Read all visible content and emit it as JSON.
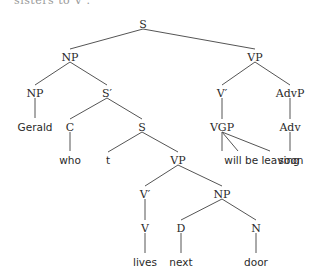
{
  "clipped_header": {
    "text": "sisters to V ."
  },
  "tree": {
    "nodes": [
      {
        "id": "S0",
        "label": "S",
        "x": 143,
        "y": 24,
        "kind": "cat"
      },
      {
        "id": "NP0",
        "label": "NP",
        "x": 70,
        "y": 57,
        "kind": "cat"
      },
      {
        "id": "VP0",
        "label": "VP",
        "x": 255,
        "y": 57,
        "kind": "cat"
      },
      {
        "id": "NP1",
        "label": "NP",
        "x": 35,
        "y": 93,
        "kind": "cat"
      },
      {
        "id": "Sbar",
        "label": "S′",
        "x": 107,
        "y": 93,
        "kind": "cat"
      },
      {
        "id": "Vbar0",
        "label": "V′",
        "x": 222,
        "y": 93,
        "kind": "cat"
      },
      {
        "id": "AdvP",
        "label": "AdvP",
        "x": 290,
        "y": 93,
        "kind": "cat"
      },
      {
        "id": "Gerald",
        "label": "Gerald",
        "x": 35,
        "y": 127,
        "kind": "word"
      },
      {
        "id": "C",
        "label": "C",
        "x": 70,
        "y": 127,
        "kind": "cat"
      },
      {
        "id": "S1",
        "label": "S",
        "x": 142,
        "y": 127,
        "kind": "cat"
      },
      {
        "id": "VGP",
        "label": "VGP",
        "x": 222,
        "y": 127,
        "kind": "cat"
      },
      {
        "id": "Adv",
        "label": "Adv",
        "x": 290,
        "y": 127,
        "kind": "cat"
      },
      {
        "id": "who",
        "label": "who",
        "x": 70,
        "y": 160,
        "kind": "word"
      },
      {
        "id": "t",
        "label": "t",
        "x": 108,
        "y": 160,
        "kind": "word"
      },
      {
        "id": "VP1",
        "label": "VP",
        "x": 178,
        "y": 160,
        "kind": "cat"
      },
      {
        "id": "will",
        "label": "will be leaving",
        "x": 262,
        "y": 160,
        "kind": "word"
      },
      {
        "id": "soon",
        "label": "soon",
        "x": 291,
        "y": 160,
        "kind": "word"
      },
      {
        "id": "Vbar1",
        "label": "V′",
        "x": 145,
        "y": 194,
        "kind": "cat"
      },
      {
        "id": "NP2",
        "label": "NP",
        "x": 222,
        "y": 194,
        "kind": "cat"
      },
      {
        "id": "V",
        "label": "V",
        "x": 145,
        "y": 228,
        "kind": "cat"
      },
      {
        "id": "D",
        "label": "D",
        "x": 181,
        "y": 228,
        "kind": "cat"
      },
      {
        "id": "N",
        "label": "N",
        "x": 256,
        "y": 228,
        "kind": "cat"
      },
      {
        "id": "lives",
        "label": "lives",
        "x": 145,
        "y": 262,
        "kind": "word"
      },
      {
        "id": "next",
        "label": "next",
        "x": 181,
        "y": 262,
        "kind": "word"
      },
      {
        "id": "door",
        "label": "door",
        "x": 256,
        "y": 262,
        "kind": "word"
      }
    ],
    "edges": [
      [
        143,
        29,
        70,
        49
      ],
      [
        143,
        29,
        255,
        49
      ],
      [
        70,
        62,
        35,
        85
      ],
      [
        70,
        62,
        107,
        85
      ],
      [
        255,
        62,
        222,
        85
      ],
      [
        255,
        62,
        290,
        85
      ],
      [
        35,
        98,
        35,
        118
      ],
      [
        107,
        98,
        70,
        119
      ],
      [
        107,
        98,
        142,
        119
      ],
      [
        222,
        98,
        222,
        119
      ],
      [
        290,
        98,
        290,
        119
      ],
      [
        70,
        132,
        70,
        151
      ],
      [
        142,
        132,
        108,
        152
      ],
      [
        142,
        132,
        178,
        152
      ],
      [
        222,
        132,
        222,
        151
      ],
      [
        222,
        132,
        238,
        151
      ],
      [
        222,
        132,
        270,
        151
      ],
      [
        290,
        132,
        290,
        151
      ],
      [
        178,
        165,
        145,
        186
      ],
      [
        178,
        165,
        222,
        186
      ],
      [
        145,
        199,
        145,
        220
      ],
      [
        222,
        199,
        181,
        220
      ],
      [
        222,
        199,
        256,
        220
      ],
      [
        145,
        233,
        145,
        253
      ],
      [
        181,
        233,
        181,
        253
      ],
      [
        256,
        233,
        256,
        253
      ]
    ]
  }
}
